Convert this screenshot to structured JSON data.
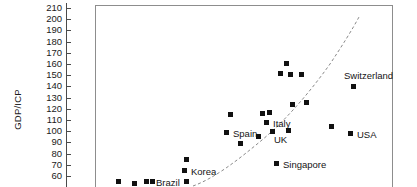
{
  "chart_data": {
    "type": "scatter",
    "title": "",
    "xlabel": "",
    "ylabel": "GDP/ICP",
    "ylim": [
      60,
      210
    ],
    "yticks": [
      60,
      70,
      80,
      90,
      100,
      110,
      120,
      130,
      140,
      150,
      160,
      170,
      180,
      190,
      200,
      210
    ],
    "grid": false,
    "legend": "none",
    "marker_style": "filled-square",
    "marker_color": "#111111",
    "trendline": {
      "style": "dashed",
      "color": "#808080",
      "description": "upward-curving dashed fit line from lower-left to upper-right"
    },
    "note": "x-axis is cropped out of the visible image; point x positions are pixel-relative",
    "points": [
      {
        "label": "",
        "px": 118,
        "py": 181,
        "value": 64
      },
      {
        "label": "",
        "px": 134,
        "py": 183,
        "value": 62
      },
      {
        "label": "",
        "px": 146,
        "py": 181,
        "value": 64
      },
      {
        "label": "",
        "px": 152,
        "py": 181,
        "value": 64
      },
      {
        "label": "Brazil",
        "px": 186,
        "py": 181,
        "value": 64,
        "label_dx": -30,
        "label_dy": -3
      },
      {
        "label": "Korea",
        "px": 184,
        "py": 170,
        "value": 74,
        "label_dx": 7,
        "label_dy": -3
      },
      {
        "label": "",
        "px": 186,
        "py": 159,
        "value": 84
      },
      {
        "label": "Spain",
        "px": 226,
        "py": 132,
        "value": 108,
        "label_dx": 7,
        "label_dy": -3
      },
      {
        "label": "",
        "px": 240,
        "py": 143,
        "value": 98
      },
      {
        "label": "",
        "px": 258,
        "py": 136,
        "value": 104
      },
      {
        "label": "",
        "px": 262,
        "py": 113,
        "value": 124
      },
      {
        "label": "",
        "px": 269,
        "py": 112,
        "value": 125
      },
      {
        "label": "Italy",
        "px": 266,
        "py": 122,
        "value": 116,
        "label_dx": 7,
        "label_dy": -3
      },
      {
        "label": "UK",
        "px": 272,
        "py": 131,
        "value": 108,
        "label_dx": 2,
        "label_dy": 4
      },
      {
        "label": "",
        "px": 288,
        "py": 130,
        "value": 109
      },
      {
        "label": "",
        "px": 286,
        "py": 63,
        "value": 169
      },
      {
        "label": "",
        "px": 280,
        "py": 73,
        "value": 160
      },
      {
        "label": "",
        "px": 290,
        "py": 74,
        "value": 159
      },
      {
        "label": "",
        "px": 301,
        "py": 74,
        "value": 159
      },
      {
        "label": "",
        "px": 292,
        "py": 104,
        "value": 133
      },
      {
        "label": "",
        "px": 306,
        "py": 102,
        "value": 134
      },
      {
        "label": "",
        "px": 230,
        "py": 114,
        "value": 123
      },
      {
        "label": "Singapore",
        "px": 276,
        "py": 163,
        "value": 79,
        "label_dx": 7,
        "label_dy": -3
      },
      {
        "label": "Switzerland",
        "px": 353,
        "py": 86,
        "value": 149,
        "label_dx": -9,
        "label_dy": -15
      },
      {
        "label": "USA",
        "px": 350,
        "py": 133,
        "value": 107,
        "label_dx": 7,
        "label_dy": -3
      },
      {
        "label": "",
        "px": 331,
        "py": 126,
        "value": 113
      }
    ],
    "trend_path": "M 193 186 C 215 178, 238 160, 262 140 C 286 120, 310 92, 330 64 C 342 46, 352 30, 359 17"
  }
}
